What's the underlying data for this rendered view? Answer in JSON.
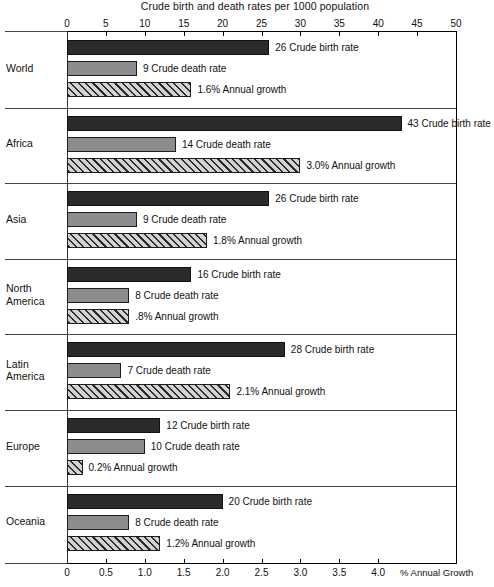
{
  "chart_data": {
    "type": "bar",
    "title": "Crude birth and death rates per 1000 population",
    "xlabel_top": "Crude birth and death rates per 1000 population",
    "xlabel_bottom": "% Annual Growth",
    "orientation": "horizontal",
    "grid": false,
    "legend": "inline-labels",
    "top_axis": {
      "label": "Crude birth and death rates per 1000 population",
      "ticks": [
        "0",
        "5",
        "10",
        "15",
        "20",
        "25",
        "30",
        "35",
        "40",
        "45",
        "50"
      ],
      "range": [
        0,
        50
      ]
    },
    "bottom_axis": {
      "label": "% Annual Growth",
      "ticks": [
        "0",
        "0.5",
        "1.0",
        "1.5",
        "2.0",
        "2.5",
        "3.0",
        "3.5",
        "4.0"
      ],
      "range": [
        0,
        5
      ]
    },
    "series": [
      {
        "name": "Crude birth rate",
        "axis": "top"
      },
      {
        "name": "Crude death rate",
        "axis": "top"
      },
      {
        "name": "Annual growth",
        "axis": "bottom"
      }
    ],
    "categories": [
      "World",
      "Africa",
      "Asia",
      "North America",
      "Latin America",
      "Europe",
      "Oceania"
    ],
    "regions": [
      {
        "name": "World",
        "label_lines": [
          "World"
        ],
        "bars": [
          {
            "series": "birth",
            "value": 26,
            "label": "26 Crude birth rate"
          },
          {
            "series": "death",
            "value": 9,
            "label": "9 Crude death rate"
          },
          {
            "series": "growth",
            "value": 1.6,
            "label": "1.6% Annual growth"
          }
        ]
      },
      {
        "name": "Africa",
        "label_lines": [
          "Africa"
        ],
        "bars": [
          {
            "series": "birth",
            "value": 43,
            "label": "43 Crude birth rate"
          },
          {
            "series": "death",
            "value": 14,
            "label": "14 Crude death rate"
          },
          {
            "series": "growth",
            "value": 3.0,
            "label": "3.0% Annual growth"
          }
        ]
      },
      {
        "name": "Asia",
        "label_lines": [
          "Asia"
        ],
        "bars": [
          {
            "series": "birth",
            "value": 26,
            "label": "26 Crude birth rate"
          },
          {
            "series": "death",
            "value": 9,
            "label": "9 Crude death rate"
          },
          {
            "series": "growth",
            "value": 1.8,
            "label": "1.8% Annual growth"
          }
        ]
      },
      {
        "name": "North America",
        "label_lines": [
          "North",
          "America"
        ],
        "bars": [
          {
            "series": "birth",
            "value": 16,
            "label": "16 Crude birth rate"
          },
          {
            "series": "death",
            "value": 8,
            "label": "8 Crude death rate"
          },
          {
            "series": "growth",
            "value": 0.8,
            "label": ".8% Annual growth"
          }
        ]
      },
      {
        "name": "Latin America",
        "label_lines": [
          "Latin",
          "America"
        ],
        "bars": [
          {
            "series": "birth",
            "value": 28,
            "label": "28 Crude birth rate"
          },
          {
            "series": "death",
            "value": 7,
            "label": "7 Crude death rate"
          },
          {
            "series": "growth",
            "value": 2.1,
            "label": "2.1% Annual growth"
          }
        ]
      },
      {
        "name": "Europe",
        "label_lines": [
          "Europe"
        ],
        "bars": [
          {
            "series": "birth",
            "value": 12,
            "label": "12 Crude birth rate"
          },
          {
            "series": "death",
            "value": 10,
            "label": "10 Crude death rate"
          },
          {
            "series": "growth",
            "value": 0.2,
            "label": "0.2% Annual growth"
          }
        ]
      },
      {
        "name": "Oceania",
        "label_lines": [
          "Oceania"
        ],
        "bars": [
          {
            "series": "birth",
            "value": 20,
            "label": "20 Crude birth rate"
          },
          {
            "series": "death",
            "value": 8,
            "label": "8 Crude death rate"
          },
          {
            "series": "growth",
            "value": 1.2,
            "label": "1.2% Annual growth"
          }
        ]
      }
    ]
  },
  "colors": {
    "birth": "#2b2b2b",
    "death": "#8c8c8c",
    "growth": "#b8b8b8",
    "axis": "#000000",
    "separator": "#444444"
  }
}
